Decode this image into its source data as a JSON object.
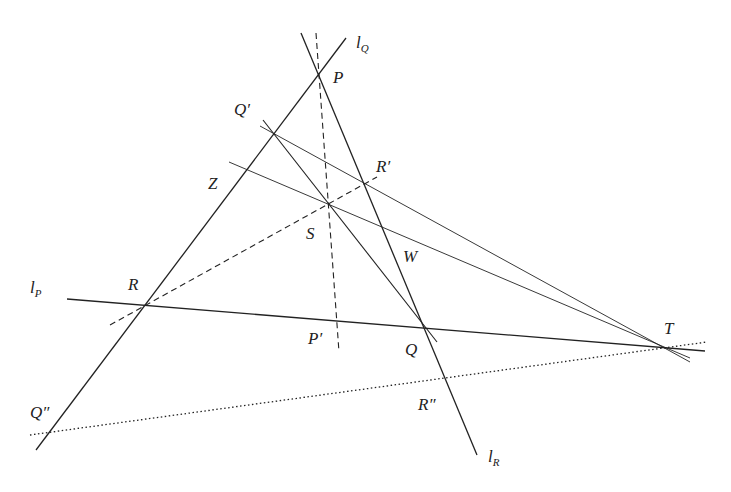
{
  "diagram": {
    "type": "projective-geometry-construction",
    "lines": [
      {
        "id": "l_Q",
        "label": "l",
        "sub": "Q",
        "style": "solid"
      },
      {
        "id": "l_P",
        "label": "l",
        "sub": "P",
        "style": "solid"
      },
      {
        "id": "l_R",
        "label": "l",
        "sub": "R",
        "style": "solid"
      }
    ],
    "points": {
      "P": "P",
      "Q_prime": "Q′",
      "R_prime": "R′",
      "Z": "Z",
      "S": "S",
      "W": "W",
      "R": "R",
      "P_prime": "P′",
      "Q": "Q",
      "T": "T",
      "Q_dprime": "Q″",
      "R_dprime": "R″"
    },
    "line_labels": {
      "lP": "l",
      "lP_sub": "P",
      "lQ": "l",
      "lQ_sub": "Q",
      "lR": "l",
      "lR_sub": "R"
    },
    "colors": {
      "stroke": "#222222",
      "background": "#ffffff"
    }
  }
}
